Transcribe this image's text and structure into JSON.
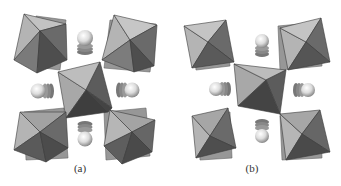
{
  "figure": {
    "panels": [
      {
        "label": "(a)",
        "description": "crystal structure with tilted octahedra and cation spheres",
        "octahedra": [
          {
            "position": "top-left",
            "tilted": true
          },
          {
            "position": "top-right",
            "tilted": true
          },
          {
            "position": "center",
            "tilted": true
          },
          {
            "position": "bottom-left",
            "tilted": true
          },
          {
            "position": "bottom-right",
            "tilted": true
          }
        ],
        "sphere_columns": [
          "top",
          "left",
          "right",
          "bottom"
        ]
      },
      {
        "label": "(b)",
        "description": "crystal structure with less tilted octahedra and cation spheres",
        "octahedra": [
          {
            "position": "top-left",
            "tilted": false
          },
          {
            "position": "top-right",
            "tilted": false
          },
          {
            "position": "center",
            "tilted": false
          },
          {
            "position": "bottom-left",
            "tilted": false
          },
          {
            "position": "bottom-right",
            "tilted": false
          }
        ],
        "sphere_columns": [
          "top",
          "left",
          "right",
          "bottom"
        ]
      }
    ],
    "colors": {
      "light_face": "#b4b4b4",
      "mid_face": "#8c8c8c",
      "dark_face": "#5e5e5e",
      "darker_face": "#4a4a4a",
      "edge": "#3a3a3a",
      "sphere_light": "#f4f4f4",
      "sphere_dark": "#8a8a8a"
    }
  }
}
